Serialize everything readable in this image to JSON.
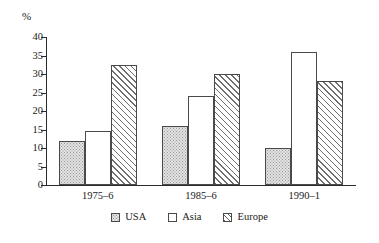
{
  "chart_data": {
    "type": "bar",
    "title": "",
    "subtitle": "",
    "xlabel": "",
    "ylabel": "%",
    "unit_label": "%",
    "categories": [
      "1975–6",
      "1985–6",
      "1990–1"
    ],
    "series": [
      {
        "name": "USA",
        "values": [
          12,
          16,
          10
        ],
        "fill": "stipple",
        "color": "#e2e2e2"
      },
      {
        "name": "Asia",
        "values": [
          14.5,
          24,
          36
        ],
        "fill": "solid",
        "color": "#ffffff"
      },
      {
        "name": "Europe",
        "values": [
          32.5,
          30,
          28
        ],
        "fill": "diagonal",
        "color": "#ffffff"
      }
    ],
    "ylim": [
      0,
      40
    ],
    "yticks": [
      0,
      5,
      10,
      15,
      20,
      25,
      30,
      35,
      40
    ],
    "ytick_labels": [
      "0",
      "5",
      "10",
      "15",
      "20",
      "25",
      "30",
      "35",
      "40"
    ],
    "grid": false,
    "legend_position": "bottom",
    "legend_entries": [
      "USA",
      "Asia",
      "Europe"
    ],
    "annotations": []
  },
  "legend": {
    "items": [
      {
        "label": "USA"
      },
      {
        "label": "Asia"
      },
      {
        "label": "Europe"
      }
    ]
  }
}
